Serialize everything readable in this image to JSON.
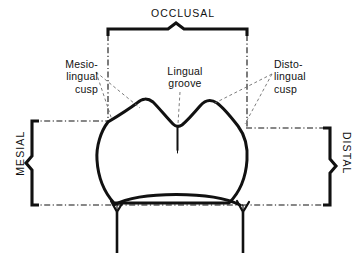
{
  "figure": {
    "background_color": "#ffffff",
    "ink_color": "#111111"
  },
  "labels": {
    "occlusal": "OCCLUSAL",
    "mesial": "MESIAL",
    "distal": "DISTAL",
    "mesiolingual_cusp": "Mesio-\nlingual\ncusp",
    "lingual_groove": "Lingual\ngroove",
    "distolingual_cusp": "Disto-\nlingual\ncusp"
  },
  "annotations": {
    "occlusal_brace": "occlusal-brace",
    "mesial_brace": "mesial-brace",
    "distal_brace": "distal-brace",
    "leader_mesiolingual": "leader-line-mesiolingual-cusp",
    "leader_lingualgroove": "leader-line-lingual-groove",
    "leader_distolingual": "leader-line-distolingual-cusp"
  },
  "structures": {
    "crown_outline": "tooth-crown-outline",
    "lingual_groove_line": "lingual-groove-line",
    "cervical_line": "cervical-line",
    "root_left": "root-outline-left",
    "root_right": "root-outline-right"
  },
  "guides": {
    "top_left_vertical": "guide-line-vertical-left",
    "top_right_vertical": "guide-line-vertical-right",
    "left_horizontal_upper": "guide-line-horizontal-left-upper",
    "left_horizontal_lower": "guide-line-horizontal-left-lower",
    "right_horizontal_upper": "guide-line-horizontal-right-upper",
    "right_horizontal_lower": "guide-line-horizontal-right-lower",
    "center_horizontal_lower": "guide-line-horizontal-center-lower"
  }
}
